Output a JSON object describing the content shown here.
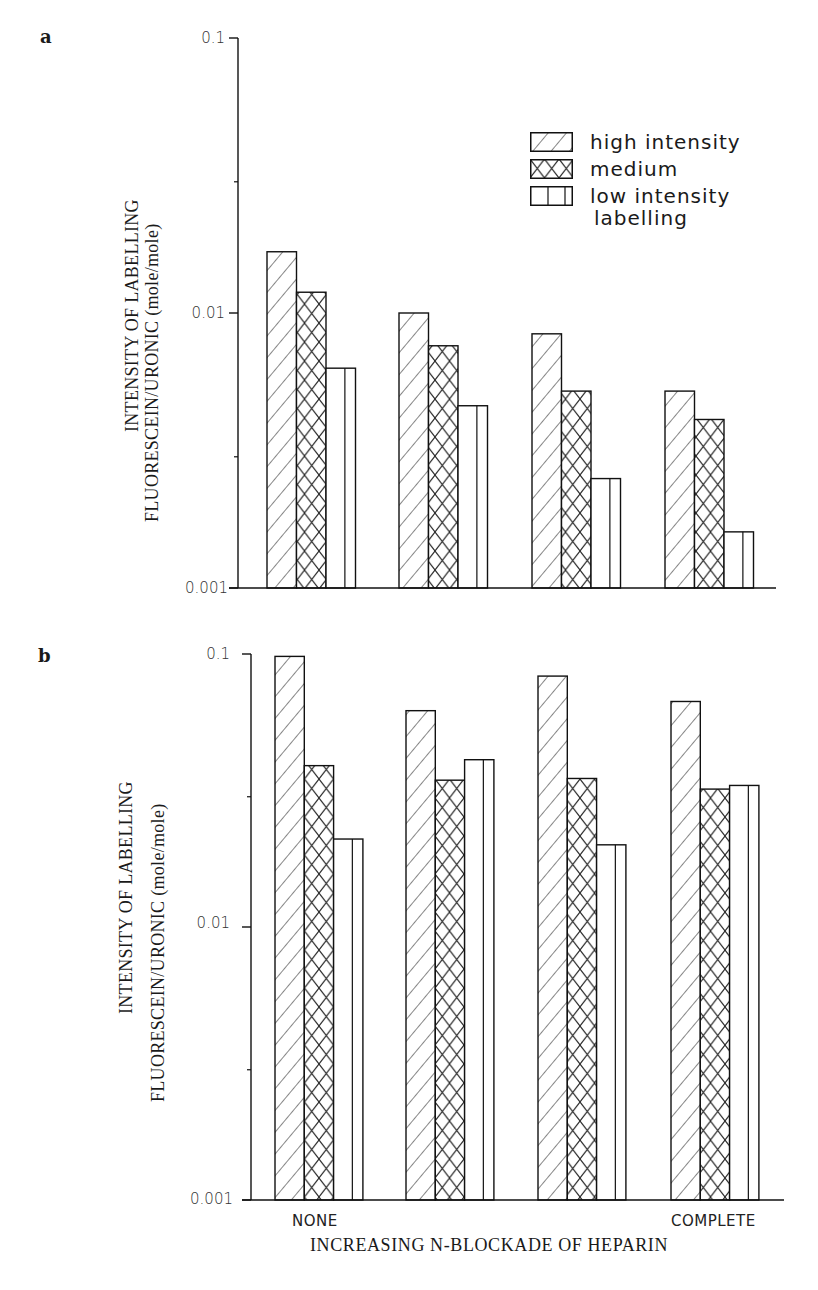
{
  "figure": {
    "panels": [
      {
        "letter": "a",
        "ylabel_line1": "INTENSITY OF LABELLING",
        "ylabel_line2": "FLUORESCEIN/URONIC  (mole/mole)",
        "ticks": [
          {
            "label": "0.1",
            "value": 0.1
          },
          {
            "label": "0.01",
            "value": 0.01
          },
          {
            "label": "0.001",
            "value": 0.001
          }
        ]
      },
      {
        "letter": "b",
        "ylabel_line1": "INTENSITY OF LABELLING",
        "ylabel_line2": "FLUORESCEIN/URONIC  (mole/mole)",
        "ticks": [
          {
            "label": "0.1",
            "value": 0.1
          },
          {
            "label": "0.01",
            "value": 0.01
          },
          {
            "label": "0.001",
            "value": 0.001
          }
        ]
      }
    ],
    "legend": {
      "items": [
        {
          "label": "high intensity",
          "pattern": "diagonal-hatch"
        },
        {
          "label": "medium",
          "pattern": "cross-hatch"
        },
        {
          "label": "low intensity",
          "pattern": "vertical-lines"
        }
      ],
      "continuation": "labelling"
    },
    "x_categories": {
      "first": "NONE",
      "last": "COMPLETE"
    },
    "x_title": "INCREASING N-BLOCKADE OF HEPARIN"
  },
  "chart_data": [
    {
      "type": "bar",
      "title": "a",
      "xlabel": "INCREASING N-BLOCKADE OF HEPARIN",
      "ylabel": "INTENSITY OF LABELLING FLUORESCEIN/URONIC (mole/mole)",
      "yscale": "log",
      "ylim": [
        0.001,
        0.1
      ],
      "yticks": [
        0.001,
        0.01,
        0.1
      ],
      "categories": [
        "NONE",
        "",
        "",
        "COMPLETE"
      ],
      "legend_position": "upper right",
      "grid": false,
      "series": [
        {
          "name": "high intensity",
          "values": [
            0.0167,
            0.01,
            0.0084,
            0.0052
          ]
        },
        {
          "name": "medium",
          "values": [
            0.0119,
            0.0076,
            0.0052,
            0.0041
          ]
        },
        {
          "name": "low intensity labelling",
          "values": [
            0.0063,
            0.0046,
            0.0025,
            0.0016
          ]
        }
      ]
    },
    {
      "type": "bar",
      "title": "b",
      "xlabel": "INCREASING N-BLOCKADE OF HEPARIN",
      "ylabel": "INTENSITY OF LABELLING FLUORESCEIN/URONIC (mole/mole)",
      "yscale": "log",
      "ylim": [
        0.001,
        0.1
      ],
      "yticks": [
        0.001,
        0.01,
        0.1
      ],
      "categories": [
        "NONE",
        "",
        "",
        "COMPLETE"
      ],
      "grid": false,
      "series": [
        {
          "name": "high intensity",
          "values": [
            0.098,
            0.062,
            0.083,
            0.067
          ]
        },
        {
          "name": "medium",
          "values": [
            0.039,
            0.0345,
            0.035,
            0.032
          ]
        },
        {
          "name": "low intensity labelling",
          "values": [
            0.021,
            0.041,
            0.02,
            0.033
          ]
        }
      ]
    }
  ]
}
